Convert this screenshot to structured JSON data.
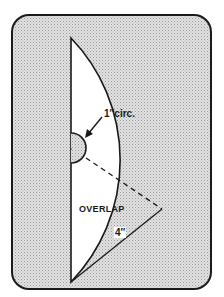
{
  "diagram": {
    "type": "pattern-template",
    "shape": "circular sector with semicircular notch",
    "labels": {
      "circ": "1″circ.",
      "overlap": "OVERLAP",
      "length": "4″"
    },
    "colors": {
      "background_fill": "#d6d6d6",
      "stroke": "#1a1a1a",
      "sector_fill": "#ffffff"
    }
  }
}
